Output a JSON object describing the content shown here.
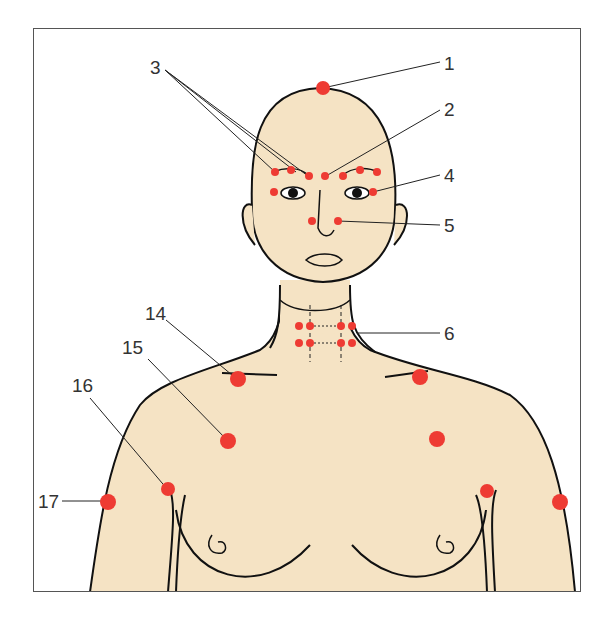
{
  "figure": {
    "title": "",
    "skin_color": "#f5e3c4",
    "point_color": "#ee3b33",
    "outline_color": "#111111",
    "labels": [
      {
        "id": "1",
        "text": "1",
        "x": 444,
        "y": 54
      },
      {
        "id": "2",
        "text": "2",
        "x": 444,
        "y": 100
      },
      {
        "id": "3",
        "text": "3",
        "x": 150,
        "y": 58
      },
      {
        "id": "4",
        "text": "4",
        "x": 444,
        "y": 166
      },
      {
        "id": "5",
        "text": "5",
        "x": 444,
        "y": 216
      },
      {
        "id": "6",
        "text": "6",
        "x": 444,
        "y": 324
      },
      {
        "id": "14",
        "text": "14",
        "x": 145,
        "y": 304
      },
      {
        "id": "15",
        "text": "15",
        "x": 122,
        "y": 338
      },
      {
        "id": "16",
        "text": "16",
        "x": 72,
        "y": 376
      },
      {
        "id": "17",
        "text": "17",
        "x": 38,
        "y": 492
      }
    ]
  }
}
